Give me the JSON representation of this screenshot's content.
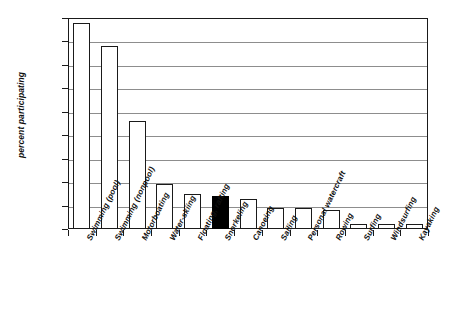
{
  "chart_data": {
    "type": "bar",
    "title": "",
    "subtitle": "",
    "xlabel": "",
    "ylabel": "percent participating",
    "ylim": [
      0,
      45
    ],
    "ytick_labels": [
      "45%",
      "40%",
      "35%",
      "30%",
      "25%",
      "20%",
      "15%",
      "10%",
      "5%",
      "0%"
    ],
    "ytick_values": [
      45,
      40,
      35,
      30,
      25,
      20,
      15,
      10,
      5,
      0
    ],
    "grid": true,
    "legend": "none",
    "categories": [
      "Swimming (pool)",
      "Swimming (nonpool)",
      "Motorboating",
      "Water-skiing",
      "Floating, rafting",
      "Snorkeling",
      "Canoeing",
      "Sailing",
      "Personal watercraft",
      "Rowing",
      "Surfing",
      "Windsurfing",
      "Kayaking"
    ],
    "values": [
      44,
      39,
      23,
      9.5,
      7.5,
      7,
      6.5,
      4.5,
      4.5,
      4,
      1,
      1,
      1
    ],
    "value_labels": [
      "44%",
      "39%",
      "23%",
      "9.5%",
      "7.5%",
      "7%",
      "6.5%",
      "4.5%",
      "4.5%",
      "4%",
      "1%",
      "1%",
      "1%"
    ],
    "highlighted_category": "Snorkeling",
    "highlight_index": 5,
    "colors": {
      "bar_fill": "#ffffff",
      "bar_stroke": "#1a1a1a",
      "highlight_fill": "#000000",
      "gridline": "#8d8d8d",
      "axis": "#1a1a1a",
      "text": "#111111",
      "background": "#ffffff"
    }
  }
}
